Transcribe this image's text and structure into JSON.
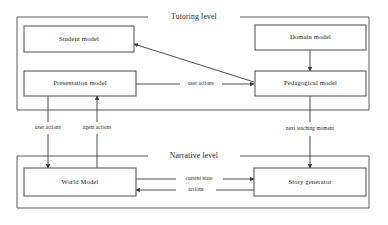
{
  "diagram": {
    "frames": [
      {
        "id": "tutoring",
        "label": "Tutoring level"
      },
      {
        "id": "narrative",
        "label": "Narrative level"
      }
    ],
    "nodes": [
      {
        "id": "student-model",
        "label": "Student model"
      },
      {
        "id": "domain-model",
        "label": "Domain model"
      },
      {
        "id": "presentation-model",
        "label": "Presentation model"
      },
      {
        "id": "pedagogical-model",
        "label": "Pedagogical model"
      },
      {
        "id": "world-model",
        "label": "World Model"
      },
      {
        "id": "story-generator",
        "label": "Story generator"
      }
    ],
    "edges": [
      {
        "id": "edge-user-actions-top",
        "label": "user actions",
        "from": "presentation-model",
        "to": "pedagogical-model"
      },
      {
        "id": "edge-pedagogical-student",
        "label": "",
        "from": "pedagogical-model",
        "to": "student-model"
      },
      {
        "id": "edge-domain-pedagogical",
        "label": "",
        "from": "domain-model",
        "to": "pedagogical-model"
      },
      {
        "id": "edge-user-actions-down",
        "label": "user actions",
        "from": "presentation-model",
        "to": "world-model"
      },
      {
        "id": "edge-agent-actions",
        "label": "agent actions",
        "from": "world-model",
        "to": "presentation-model"
      },
      {
        "id": "edge-next-teaching-moment",
        "label": "next teaching moment",
        "from": "pedagogical-model",
        "to": "story-generator"
      },
      {
        "id": "edge-current-state",
        "label": "current state",
        "from": "world-model",
        "to": "story-generator"
      },
      {
        "id": "edge-actions",
        "label": "actions",
        "from": "story-generator",
        "to": "world-model"
      }
    ]
  }
}
